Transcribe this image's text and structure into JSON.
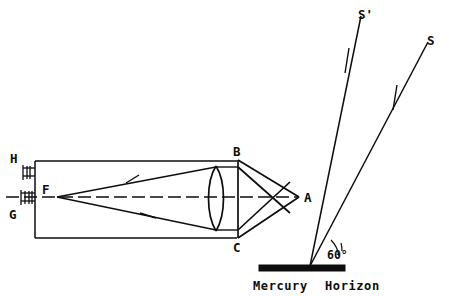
{
  "figure": {
    "background_color": "#ffffff",
    "ink_color": "#0d0d0d"
  },
  "labels": {
    "eyepiece_top": "H",
    "eyepiece_bottom": "G",
    "focus": "F",
    "prism_top": "B",
    "prism_bottom": "C",
    "prism_apex": "A",
    "ray_incident": "S",
    "ray_reflected": "S'",
    "angle": "60°",
    "surface_left": "Mercury",
    "surface_right": "Horizon"
  },
  "parts": {
    "telescope_tube": "telescope-tube",
    "objective_lens": "biconvex-objective-lens",
    "prism": "triangular-prism",
    "mercury_surface": "mercury-horizon-bar",
    "optical_axis": "dashed-optical-axis"
  },
  "geometry": {
    "tube": {
      "x1": 35,
      "y1": 161,
      "x2": 237,
      "y2": 238
    },
    "focus_point": {
      "x": 56,
      "y": 197
    },
    "lens": {
      "x": 216,
      "y_top": 166,
      "y_bottom": 231
    },
    "prism": {
      "b": {
        "x": 238,
        "y": 160
      },
      "c": {
        "x": 238,
        "y": 238
      },
      "a": {
        "x": 299,
        "y": 197
      }
    },
    "mercury_bar": {
      "x1": 259,
      "y1": 265,
      "x2": 345,
      "y2": 271
    },
    "reflection_point": {
      "x": 310,
      "y": 266
    },
    "ray_s_top": {
      "x": 428,
      "y": 42
    },
    "ray_sprime_top": {
      "x": 361,
      "y": 16
    },
    "angle_degrees": 60
  }
}
